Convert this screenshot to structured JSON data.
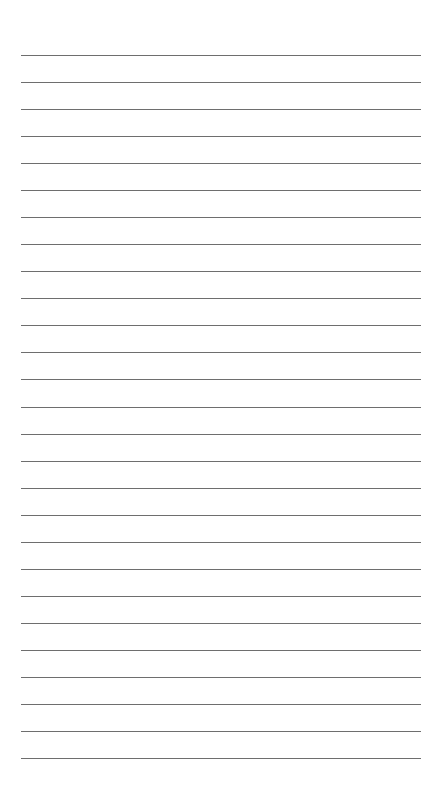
{
  "page": {
    "type": "lined-paper",
    "background": "#ffffff",
    "line_color": "#6e6e6e",
    "line_count": 27,
    "first_line_y": 55,
    "line_spacing": 27.04,
    "line_left": 21,
    "line_width": 400
  }
}
